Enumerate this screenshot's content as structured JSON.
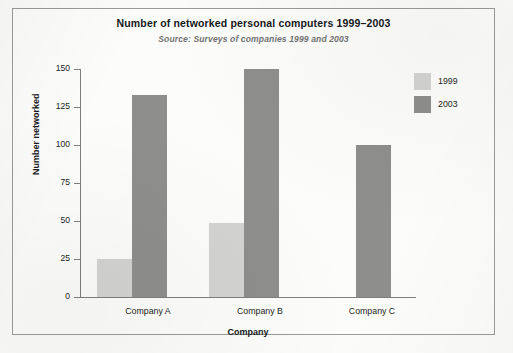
{
  "chart_data": {
    "type": "bar",
    "title": "Number of networked personal computers 1999–2003",
    "subtitle": "Source: Surveys of companies 1999 and 2003",
    "xlabel": "Company",
    "ylabel": "Number networked",
    "categories": [
      "Company A",
      "Company B",
      "Company C"
    ],
    "series": [
      {
        "name": "1999",
        "color": "#d3d3d2",
        "values": [
          25,
          49,
          0
        ]
      },
      {
        "name": "2003",
        "color": "#8e8e8c",
        "values": [
          133,
          150,
          100
        ]
      }
    ],
    "ylim": [
      0,
      150
    ],
    "yticks": [
      0,
      25,
      50,
      75,
      100,
      125,
      150
    ],
    "ytick_labels": [
      "0",
      "25",
      "50",
      "75",
      "100",
      "125",
      "150"
    ],
    "grid": false,
    "legend_position": "right-top"
  },
  "legend": {
    "items": [
      {
        "label": "1999",
        "color": "#d3d3d2"
      },
      {
        "label": "2003",
        "color": "#8e8e8c"
      }
    ]
  },
  "colors": {
    "series_1999": "#d3d3d2",
    "series_2003": "#8e8e8c",
    "axis": "#7e7e7c",
    "frame": "#9a9a98",
    "page_background": "#fbfbfa"
  }
}
